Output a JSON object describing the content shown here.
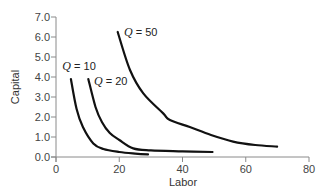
{
  "chart_data": {
    "type": "line",
    "title": "",
    "xlabel": "Labor",
    "ylabel": "Capital",
    "xlim": [
      0,
      80
    ],
    "ylim": [
      0,
      7
    ],
    "x_ticks": [
      0,
      20,
      40,
      60,
      80
    ],
    "x_tick_labels": [
      "0",
      "20",
      "40",
      "60",
      "80"
    ],
    "y_ticks": [
      0,
      1,
      2,
      3,
      4,
      5,
      6,
      7
    ],
    "y_tick_labels": [
      "0.0",
      "1.0",
      "2.0",
      "3.0",
      "4.0",
      "5.0",
      "6.0",
      "7.0"
    ],
    "grid": false,
    "legend": "none (inline curve labels)",
    "series": [
      {
        "name": "Q = 10",
        "label": {
          "q": "Q",
          "rest": " = 10",
          "x": 2,
          "y": 4.35
        },
        "points": [
          [
            4.7,
            3.9
          ],
          [
            6.5,
            2.4
          ],
          [
            8.5,
            1.5
          ],
          [
            11.8,
            0.68
          ],
          [
            15,
            0.4
          ],
          [
            20,
            0.25
          ],
          [
            25,
            0.17
          ],
          [
            29.1,
            0.13
          ]
        ]
      },
      {
        "name": "Q = 20",
        "label": {
          "q": "Q",
          "rest": " = 20",
          "x": 12,
          "y": 3.6
        },
        "points": [
          [
            10.2,
            3.9
          ],
          [
            12.5,
            2.5
          ],
          [
            14.5,
            1.75
          ],
          [
            17,
            1.2
          ],
          [
            20,
            0.85
          ],
          [
            24.4,
            0.43
          ],
          [
            30,
            0.33
          ],
          [
            40,
            0.28
          ],
          [
            49.5,
            0.25
          ]
        ]
      },
      {
        "name": "Q = 50",
        "label": {
          "q": "Q",
          "rest": " = 50",
          "x": 21.5,
          "y": 6.05
        },
        "points": [
          [
            19.5,
            6.25
          ],
          [
            23.4,
            4.35
          ],
          [
            27.6,
            3.18
          ],
          [
            33.9,
            2.18
          ],
          [
            36,
            1.85
          ],
          [
            42.3,
            1.5
          ],
          [
            49,
            1.1
          ],
          [
            56,
            0.77
          ],
          [
            63,
            0.6
          ],
          [
            69.9,
            0.52
          ]
        ]
      }
    ]
  }
}
